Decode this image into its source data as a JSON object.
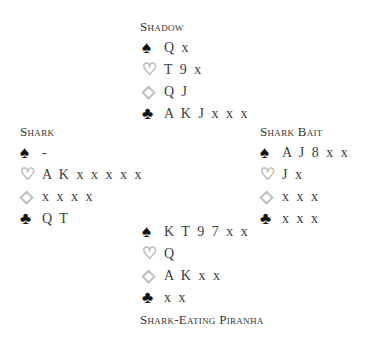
{
  "hands": {
    "north": {
      "name": "Shadow",
      "spades": "Q x",
      "hearts": "T 9 x",
      "diamonds": "Q J",
      "clubs": "A K J x x x"
    },
    "west": {
      "name": "Shark",
      "spades": "-",
      "hearts": "A K x x x x x",
      "diamonds": "x x x x",
      "clubs": "Q T"
    },
    "east": {
      "name": "Shark Bait",
      "spades": "A J 8 x x",
      "hearts": "J x",
      "diamonds": "x x x",
      "clubs": "x x x"
    },
    "south": {
      "name": "Shark-Eating Piranha",
      "spades": "K T 9 7 x x",
      "hearts": "Q",
      "diamonds": "A K x x",
      "clubs": "x x"
    }
  },
  "suit_symbols": {
    "spades": "♠",
    "hearts": "♡",
    "diamonds": "◇",
    "clubs": "♣"
  }
}
